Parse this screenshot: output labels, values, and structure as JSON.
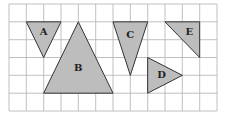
{
  "grid": {
    "columns": 12,
    "rows": 6,
    "x_lines": [
      9,
      26.3,
      43.7,
      61,
      78.3,
      95.7,
      113,
      130.3,
      147.7,
      165,
      182.3,
      199.7,
      217
    ],
    "y_lines": [
      4,
      21.8,
      39.7,
      57.5,
      75.3,
      93.2,
      111
    ],
    "line_color": "#b0b0b0",
    "background": "#ffffff"
  },
  "shape_fill": "#bdbdbd",
  "shape_stroke": "#333333",
  "shapes": [
    {
      "label": "A",
      "vertices_grid": [
        [
          1,
          1
        ],
        [
          3,
          1
        ],
        [
          2,
          3
        ]
      ],
      "label_pos_grid": [
        2,
        1.6
      ]
    },
    {
      "label": "B",
      "vertices_grid": [
        [
          4,
          1
        ],
        [
          6,
          5
        ],
        [
          2,
          5
        ]
      ],
      "label_pos_grid": [
        4,
        3.6
      ]
    },
    {
      "label": "C",
      "vertices_grid": [
        [
          6,
          1
        ],
        [
          8,
          1
        ],
        [
          7,
          4
        ]
      ],
      "label_pos_grid": [
        7,
        1.75
      ]
    },
    {
      "label": "D",
      "vertices_grid": [
        [
          8,
          3
        ],
        [
          10,
          4
        ],
        [
          8,
          5
        ]
      ],
      "label_pos_grid": [
        8.8,
        4.0
      ]
    },
    {
      "label": "E",
      "vertices_grid": [
        [
          9,
          1
        ],
        [
          11,
          1
        ],
        [
          11,
          3
        ]
      ],
      "label_pos_grid": [
        10.4,
        1.6
      ]
    }
  ]
}
